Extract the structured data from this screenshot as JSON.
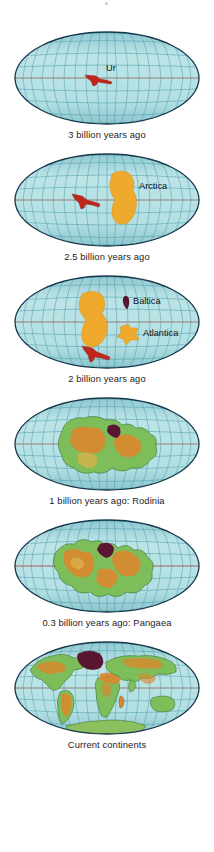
{
  "figure": {
    "background_color": "#ffffff",
    "ocean_color": "#a8d8dc",
    "ocean_color_light": "#c3e6e8",
    "graticule_color": "#3c8f9e",
    "outline_color": "#17384c",
    "equator_color": "#8a4a3a",
    "craton_red": "#c0261c",
    "craton_orange": "#efa92c",
    "craton_maroon": "#5a1530",
    "land_green": "#7ebe5a",
    "land_green_dark": "#59a845",
    "interior_orange": "#e0842a",
    "interior_tan": "#d8b24a",
    "caption_color": "#1c1c1c"
  },
  "panels": [
    {
      "id": "panel-ur",
      "caption": "3 billion years ago",
      "landmass_labels": [
        {
          "name": "Ur",
          "text": "Ur",
          "x": 105,
          "y": 40,
          "color": "#c0261c"
        }
      ],
      "landmasses": [
        {
          "name": "ur-craton",
          "color": "#c0261c"
        }
      ]
    },
    {
      "id": "panel-arctica",
      "caption": "2.5 billion years ago",
      "landmass_labels": [
        {
          "name": "Arctica",
          "text": "Arctica",
          "x": 128,
          "y": 38,
          "color": "#efa92c"
        }
      ],
      "landmasses": [
        {
          "name": "ur-craton",
          "color": "#c0261c"
        },
        {
          "name": "arctica-craton",
          "color": "#efa92c"
        }
      ]
    },
    {
      "id": "panel-baltica-atlantica",
      "caption": "2 billion years ago",
      "landmass_labels": [
        {
          "name": "Baltica",
          "text": "Baltica",
          "x": 126,
          "y": 31,
          "color": "#5a1530"
        },
        {
          "name": "Atlantica",
          "text": "Atlantica",
          "x": 130,
          "y": 58,
          "color": "#efa92c"
        }
      ],
      "landmasses": [
        {
          "name": "ur-craton",
          "color": "#c0261c"
        },
        {
          "name": "arctica-craton",
          "color": "#efa92c"
        },
        {
          "name": "baltica-craton",
          "color": "#5a1530"
        },
        {
          "name": "atlantica-craton",
          "color": "#efa92c"
        }
      ]
    },
    {
      "id": "panel-rodinia",
      "caption": "1 billion years ago: Rodinia",
      "landmass_labels": [],
      "landmasses": [
        {
          "name": "rodinia-supercontinent",
          "color": "#7ebe5a"
        }
      ]
    },
    {
      "id": "panel-pangaea",
      "caption": "0.3 billion years ago: Pangaea",
      "landmass_labels": [],
      "landmasses": [
        {
          "name": "pangaea-supercontinent",
          "color": "#7ebe5a"
        }
      ]
    },
    {
      "id": "panel-current",
      "caption": "Current continents",
      "landmass_labels": [],
      "landmasses": [
        {
          "name": "north-america",
          "color": "#7ebe5a"
        },
        {
          "name": "south-america",
          "color": "#7ebe5a"
        },
        {
          "name": "africa",
          "color": "#7ebe5a"
        },
        {
          "name": "eurasia",
          "color": "#7ebe5a"
        },
        {
          "name": "australia",
          "color": "#7ebe5a"
        },
        {
          "name": "antarctica",
          "color": "#7ebe5a"
        },
        {
          "name": "greenland",
          "color": "#5a1530"
        }
      ]
    }
  ]
}
